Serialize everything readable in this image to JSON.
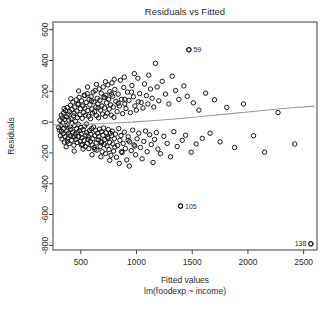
{
  "chart_data": {
    "type": "scatter",
    "title": "Residuals vs Fitted",
    "xlabel": "Fitted values",
    "sublabel": "lm(foodexp ~ income)",
    "ylabel": "Residuals",
    "xlim": [
      250,
      2620
    ],
    "ylim": [
      -830,
      650
    ],
    "grid": false,
    "legend": null,
    "xticks": [
      500,
      1000,
      1500,
      2000,
      2500
    ],
    "xtick_labels": [
      "500",
      "1000",
      "1500",
      "2000",
      "2500"
    ],
    "yticks": [
      600,
      400,
      200,
      0,
      -200,
      -400,
      -600,
      -800
    ],
    "ytick_labels": [
      "600",
      "400",
      "200",
      "0",
      "-200",
      "-400",
      "-600",
      "-800"
    ],
    "marker": "open-circle",
    "marker_color": "#141414",
    "smoother_color": "#9a9a9a",
    "annotations": [
      {
        "label": "59",
        "x": 1470,
        "y": 470,
        "side": "right"
      },
      {
        "label": "105",
        "x": 1395,
        "y": -545,
        "side": "right"
      },
      {
        "label": "138",
        "x": 2565,
        "y": -790,
        "side": "left"
      }
    ],
    "smoother": [
      [
        260,
        -18
      ],
      [
        420,
        -16
      ],
      [
        600,
        -12
      ],
      [
        800,
        -6
      ],
      [
        1000,
        2
      ],
      [
        1200,
        12
      ],
      [
        1400,
        24
      ],
      [
        1600,
        38
      ],
      [
        1800,
        52
      ],
      [
        2000,
        66
      ],
      [
        2200,
        80
      ],
      [
        2400,
        93
      ],
      [
        2600,
        104
      ]
    ],
    "points": [
      [
        300,
        -35
      ],
      [
        308,
        -52
      ],
      [
        312,
        12
      ],
      [
        316,
        -88
      ],
      [
        320,
        -20
      ],
      [
        324,
        45
      ],
      [
        327,
        -60
      ],
      [
        330,
        -110
      ],
      [
        334,
        28
      ],
      [
        338,
        -5
      ],
      [
        341,
        -75
      ],
      [
        345,
        60
      ],
      [
        348,
        -40
      ],
      [
        352,
        -130
      ],
      [
        355,
        18
      ],
      [
        358,
        -95
      ],
      [
        362,
        75
      ],
      [
        365,
        -25
      ],
      [
        368,
        -160
      ],
      [
        371,
        35
      ],
      [
        374,
        -58
      ],
      [
        377,
        95
      ],
      [
        380,
        -18
      ],
      [
        383,
        -105
      ],
      [
        386,
        52
      ],
      [
        389,
        -72
      ],
      [
        392,
        14
      ],
      [
        395,
        -140
      ],
      [
        398,
        68
      ],
      [
        401,
        -30
      ],
      [
        404,
        -88
      ],
      [
        407,
        110
      ],
      [
        410,
        -48
      ],
      [
        413,
        22
      ],
      [
        416,
        -118
      ],
      [
        419,
        82
      ],
      [
        422,
        -8
      ],
      [
        425,
        -65
      ],
      [
        428,
        130
      ],
      [
        431,
        -95
      ],
      [
        434,
        40
      ],
      [
        437,
        -150
      ],
      [
        440,
        58
      ],
      [
        443,
        -22
      ],
      [
        446,
        98
      ],
      [
        449,
        -78
      ],
      [
        452,
        5
      ],
      [
        455,
        -112
      ],
      [
        458,
        145
      ],
      [
        461,
        -42
      ],
      [
        464,
        72
      ],
      [
        467,
        -132
      ],
      [
        470,
        30
      ],
      [
        473,
        -68
      ],
      [
        476,
        115
      ],
      [
        479,
        -15
      ],
      [
        482,
        -92
      ],
      [
        485,
        160
      ],
      [
        488,
        -55
      ],
      [
        491,
        48
      ],
      [
        494,
        -125
      ],
      [
        497,
        88
      ],
      [
        500,
        -35
      ],
      [
        503,
        -78
      ],
      [
        506,
        138
      ],
      [
        509,
        -102
      ],
      [
        512,
        25
      ],
      [
        515,
        -145
      ],
      [
        518,
        105
      ],
      [
        521,
        -48
      ],
      [
        524,
        62
      ],
      [
        527,
        -118
      ],
      [
        530,
        175
      ],
      [
        533,
        -28
      ],
      [
        536,
        92
      ],
      [
        539,
        -158
      ],
      [
        542,
        45
      ],
      [
        545,
        -85
      ],
      [
        548,
        128
      ],
      [
        551,
        -12
      ],
      [
        554,
        -68
      ],
      [
        557,
        185
      ],
      [
        560,
        -138
      ],
      [
        563,
        75
      ],
      [
        566,
        -95
      ],
      [
        569,
        38
      ],
      [
        572,
        -172
      ],
      [
        575,
        148
      ],
      [
        578,
        -55
      ],
      [
        581,
        112
      ],
      [
        584,
        -125
      ],
      [
        587,
        22
      ],
      [
        590,
        -78
      ],
      [
        593,
        165
      ],
      [
        596,
        -42
      ],
      [
        599,
        85
      ],
      [
        602,
        -148
      ],
      [
        605,
        58
      ],
      [
        608,
        -108
      ],
      [
        611,
        195
      ],
      [
        614,
        -32
      ],
      [
        617,
        132
      ],
      [
        620,
        -165
      ],
      [
        623,
        68
      ],
      [
        626,
        -88
      ],
      [
        629,
        205
      ],
      [
        632,
        -52
      ],
      [
        635,
        98
      ],
      [
        638,
        -135
      ],
      [
        641,
        42
      ],
      [
        644,
        -182
      ],
      [
        647,
        155
      ],
      [
        650,
        -72
      ],
      [
        653,
        118
      ],
      [
        656,
        -115
      ],
      [
        659,
        28
      ],
      [
        662,
        -95
      ],
      [
        665,
        215
      ],
      [
        668,
        -45
      ],
      [
        671,
        142
      ],
      [
        674,
        -158
      ],
      [
        677,
        78
      ],
      [
        680,
        -125
      ],
      [
        683,
        188
      ],
      [
        686,
        -62
      ],
      [
        689,
        105
      ],
      [
        692,
        -192
      ],
      [
        695,
        52
      ],
      [
        698,
        -85
      ],
      [
        701,
        228
      ],
      [
        704,
        -38
      ],
      [
        707,
        162
      ],
      [
        710,
        -145
      ],
      [
        713,
        92
      ],
      [
        716,
        -112
      ],
      [
        719,
        38
      ],
      [
        722,
        -205
      ],
      [
        725,
        175
      ],
      [
        728,
        -68
      ],
      [
        731,
        125
      ],
      [
        734,
        -155
      ],
      [
        737,
        58
      ],
      [
        740,
        -98
      ],
      [
        743,
        242
      ],
      [
        746,
        -48
      ],
      [
        749,
        148
      ],
      [
        752,
        -178
      ],
      [
        755,
        85
      ],
      [
        758,
        -132
      ],
      [
        761,
        198
      ],
      [
        764,
        -72
      ],
      [
        767,
        112
      ],
      [
        770,
        -215
      ],
      [
        773,
        45
      ],
      [
        776,
        -88
      ],
      [
        779,
        255
      ],
      [
        782,
        -58
      ],
      [
        785,
        168
      ],
      [
        788,
        -142
      ],
      [
        791,
        98
      ],
      [
        794,
        -188
      ],
      [
        797,
        32
      ],
      [
        800,
        -108
      ],
      [
        805,
        212
      ],
      [
        810,
        -78
      ],
      [
        815,
        135
      ],
      [
        820,
        -228
      ],
      [
        825,
        68
      ],
      [
        830,
        -152
      ],
      [
        835,
        182
      ],
      [
        840,
        -42
      ],
      [
        845,
        105
      ],
      [
        850,
        -118
      ],
      [
        855,
        272
      ],
      [
        860,
        -88
      ],
      [
        865,
        148
      ],
      [
        870,
        -198
      ],
      [
        875,
        55
      ],
      [
        880,
        -138
      ],
      [
        885,
        225
      ],
      [
        890,
        -65
      ],
      [
        895,
        118
      ],
      [
        900,
        -172
      ],
      [
        905,
        88
      ],
      [
        912,
        -245
      ],
      [
        918,
        195
      ],
      [
        925,
        -95
      ],
      [
        932,
        142
      ],
      [
        938,
        -128
      ],
      [
        945,
        62
      ],
      [
        952,
        -185
      ],
      [
        958,
        238
      ],
      [
        965,
        -52
      ],
      [
        972,
        165
      ],
      [
        978,
        -148
      ],
      [
        985,
        105
      ],
      [
        992,
        -212
      ],
      [
        998,
        78
      ],
      [
        1005,
        -108
      ],
      [
        1012,
        285
      ],
      [
        1020,
        -72
      ],
      [
        1028,
        185
      ],
      [
        1035,
        -165
      ],
      [
        1042,
        128
      ],
      [
        1050,
        -238
      ],
      [
        1058,
        92
      ],
      [
        1065,
        -125
      ],
      [
        1072,
        248
      ],
      [
        1080,
        -58
      ],
      [
        1088,
        172
      ],
      [
        1095,
        -192
      ],
      [
        1102,
        118
      ],
      [
        1110,
        305
      ],
      [
        1118,
        -82
      ],
      [
        1125,
        215
      ],
      [
        1132,
        -145
      ],
      [
        1140,
        155
      ],
      [
        1148,
        -262
      ],
      [
        1155,
        98
      ],
      [
        1162,
        -112
      ],
      [
        1170,
        382
      ],
      [
        1178,
        -68
      ],
      [
        1185,
        228
      ],
      [
        1192,
        -175
      ],
      [
        1200,
        138
      ],
      [
        1215,
        -205
      ],
      [
        1230,
        265
      ],
      [
        1245,
        -92
      ],
      [
        1260,
        182
      ],
      [
        1275,
        -138
      ],
      [
        1290,
        118
      ],
      [
        1305,
        -225
      ],
      [
        1320,
        298
      ],
      [
        1335,
        -62
      ],
      [
        1350,
        205
      ],
      [
        1365,
        -158
      ],
      [
        1380,
        148
      ],
      [
        1395,
        -545
      ],
      [
        1410,
        -118
      ],
      [
        1425,
        235
      ],
      [
        1440,
        -85
      ],
      [
        1455,
        168
      ],
      [
        1470,
        470
      ],
      [
        1490,
        -195
      ],
      [
        1510,
        125
      ],
      [
        1535,
        -142
      ],
      [
        1560,
        78
      ],
      [
        1590,
        -105
      ],
      [
        1620,
        188
      ],
      [
        1660,
        -72
      ],
      [
        1700,
        145
      ],
      [
        1750,
        -128
      ],
      [
        1810,
        95
      ],
      [
        1880,
        -165
      ],
      [
        1960,
        118
      ],
      [
        2050,
        -88
      ],
      [
        2150,
        -195
      ],
      [
        2270,
        62
      ],
      [
        2420,
        -142
      ],
      [
        2565,
        -790
      ],
      [
        440,
        -188
      ],
      [
        480,
        202
      ],
      [
        520,
        -175
      ],
      [
        560,
        228
      ],
      [
        600,
        -212
      ],
      [
        640,
        245
      ],
      [
        680,
        -225
      ],
      [
        720,
        262
      ],
      [
        760,
        -248
      ],
      [
        800,
        278
      ],
      [
        845,
        -268
      ],
      [
        890,
        292
      ],
      [
        935,
        -285
      ],
      [
        980,
        315
      ],
      [
        350,
        88
      ],
      [
        380,
        -125
      ],
      [
        410,
        152
      ],
      [
        445,
        -95
      ],
      [
        475,
        118
      ],
      [
        505,
        -148
      ],
      [
        535,
        172
      ],
      [
        565,
        -112
      ],
      [
        595,
        138
      ],
      [
        625,
        -178
      ],
      [
        655,
        92
      ],
      [
        685,
        -135
      ],
      [
        715,
        158
      ],
      [
        745,
        -105
      ],
      [
        775,
        182
      ],
      [
        805,
        -162
      ],
      [
        835,
        122
      ],
      [
        865,
        -192
      ],
      [
        895,
        148
      ],
      [
        925,
        -118
      ],
      [
        955,
        195
      ],
      [
        985,
        -155
      ],
      [
        1015,
        132
      ]
    ]
  }
}
